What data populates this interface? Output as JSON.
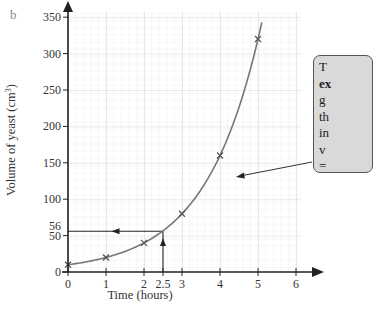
{
  "figure_label": "b",
  "chart_data": {
    "type": "line",
    "title": "",
    "xlabel": "Time (hours)",
    "ylabel": "Volume of yeast (cm³)",
    "ylabel_main": "Volume of yeast (cm",
    "ylabel_sup": "3",
    "ylabel_end": ")",
    "x": [
      0,
      1,
      2,
      3,
      4,
      5
    ],
    "values": [
      10,
      20,
      40,
      80,
      160,
      320
    ],
    "series": [
      {
        "name": "Volume of yeast",
        "x": [
          0,
          1,
          2,
          3,
          4,
          5
        ],
        "values": [
          10,
          20,
          40,
          80,
          160,
          320
        ],
        "marker": "x",
        "fit": "exponential"
      }
    ],
    "xlim": [
      0,
      6
    ],
    "ylim": [
      0,
      350
    ],
    "x_ticks": [
      "0",
      "1",
      "2",
      "2.5",
      "3",
      "4",
      "5",
      "6"
    ],
    "y_ticks": [
      "0",
      "50",
      "56",
      "100",
      "150",
      "200",
      "250",
      "300",
      "350"
    ],
    "grid": true,
    "annotations": [
      {
        "type": "reading-line",
        "x": 2.5,
        "y": 56,
        "text": "Read-off at t = 2.5 h gives 56 cm³"
      },
      {
        "type": "callout",
        "lines": [
          "T",
          "ex",
          "g",
          "th",
          "in",
          "v",
          "="
        ],
        "bold_line": 1,
        "points_to": "curve"
      }
    ],
    "legend": null
  },
  "callout": {
    "lines": [
      "T",
      "ex",
      "g",
      "th",
      "in",
      "v",
      "="
    ]
  }
}
